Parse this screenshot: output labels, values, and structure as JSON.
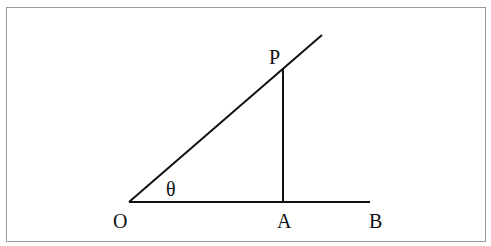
{
  "diagram": {
    "type": "geometry",
    "labels": {
      "O": "O",
      "A": "A",
      "B": "B",
      "P": "P",
      "theta": "θ"
    },
    "points": {
      "O": [
        129,
        202
      ],
      "A": [
        283,
        202
      ],
      "B": [
        370,
        202
      ],
      "P": [
        283,
        69
      ],
      "ray_end": [
        322,
        35
      ]
    },
    "colors": {
      "stroke": "#111111",
      "border": "#9a9a9a",
      "background": "#ffffff"
    }
  }
}
